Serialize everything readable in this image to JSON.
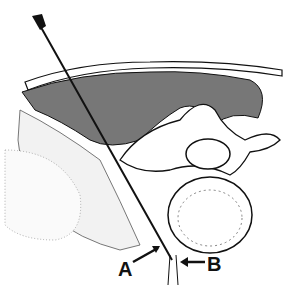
{
  "figure": {
    "labels": {
      "a": "A",
      "b": "B"
    },
    "colors": {
      "ink": "#111111",
      "muscle_fill": "#6a6a6a",
      "background": "#ffffff"
    }
  }
}
